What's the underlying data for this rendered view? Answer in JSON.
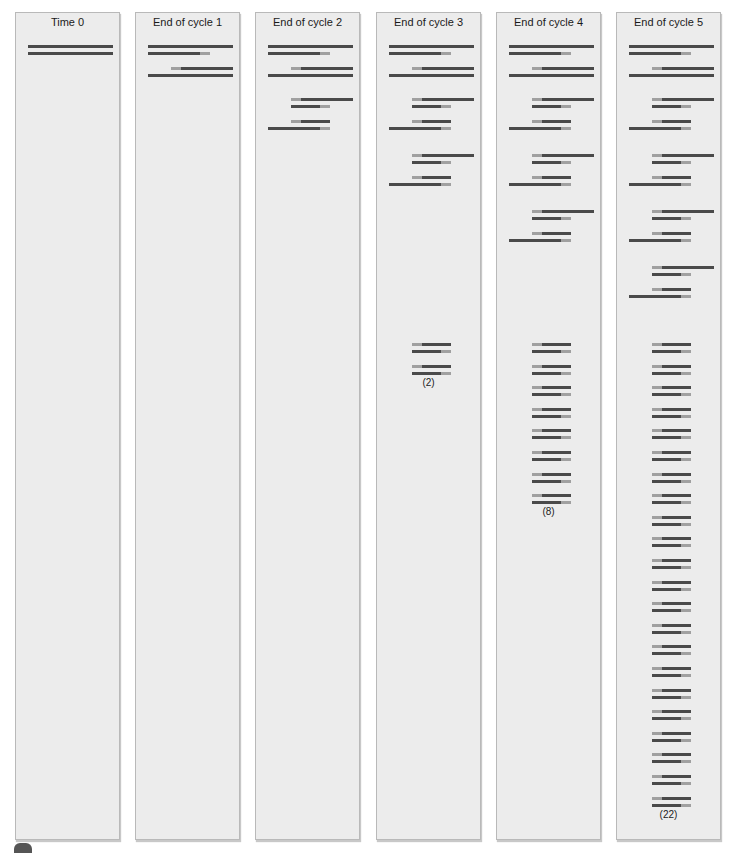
{
  "figure": {
    "panels": [
      {
        "title": "Time 0",
        "count_label": null
      },
      {
        "title": "End of cycle 1",
        "count_label": null
      },
      {
        "title": "End of cycle 2",
        "count_label": null
      },
      {
        "title": "End of cycle 3",
        "count_label": "(2)"
      },
      {
        "title": "End of cycle 4",
        "count_label": "(8)"
      },
      {
        "title": "End of cycle 5",
        "count_label": "(22)"
      }
    ],
    "legend_colors": {
      "template_strand": "#4a4a4a",
      "primer_region": "#a0a0a0",
      "panel_bg": "#ececec",
      "panel_border": "#b9b9b9"
    }
  },
  "chart_data": {
    "type": "diagram",
    "title": "",
    "categories": [
      "Time 0",
      "End of cycle 1",
      "End of cycle 2",
      "End of cycle 3",
      "End of cycle 4",
      "End of cycle 5"
    ],
    "long_strand_groups": [
      1,
      1,
      2,
      3,
      4,
      5
    ],
    "short_product_pairs": [
      0,
      0,
      0,
      2,
      8,
      22
    ],
    "annotations": [
      "(2)",
      "(8)",
      "(22)"
    ]
  }
}
